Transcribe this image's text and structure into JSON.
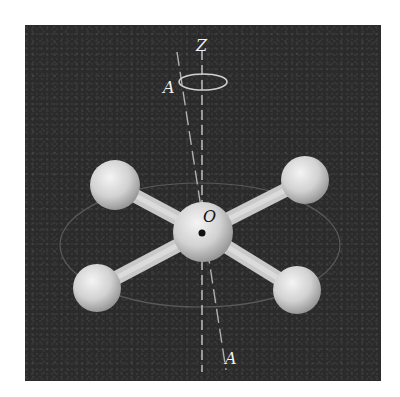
{
  "figure": {
    "type": "molecular-model-diagram",
    "labels": {
      "z_axis": "Z",
      "axis_top": "A",
      "axis_bottom": "A",
      "center": "O"
    },
    "colors": {
      "background": "#2b2b2b",
      "atom": "#d9d9d9",
      "bond": "#cfcfcf",
      "axis_line": "#bdbdbd",
      "page": "#ffffff"
    },
    "atoms": [
      {
        "name": "center",
        "cx": 203,
        "cy": 232,
        "r": 30
      },
      {
        "name": "upper-left",
        "cx": 115,
        "cy": 185,
        "r": 25
      },
      {
        "name": "upper-right",
        "cx": 305,
        "cy": 180,
        "r": 24
      },
      {
        "name": "lower-left",
        "cx": 97,
        "cy": 288,
        "r": 24
      },
      {
        "name": "lower-right",
        "cx": 297,
        "cy": 290,
        "r": 24
      }
    ]
  }
}
